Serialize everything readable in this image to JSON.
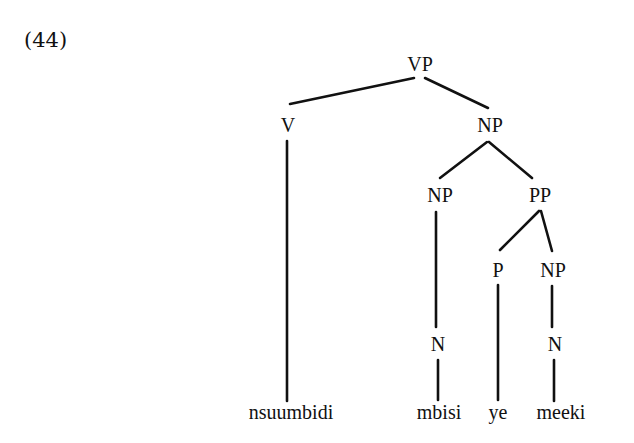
{
  "example_number": "(44)",
  "tree": {
    "nodes": {
      "vp": "VP",
      "v": "V",
      "np_obj": "NP",
      "np_head": "NP",
      "pp": "PP",
      "p": "P",
      "np_pp": "NP",
      "n1": "N",
      "n2": "N"
    },
    "words": {
      "w1": "nsuumbidi",
      "w2": "mbisi",
      "w3": "ye",
      "w4": "meeki"
    },
    "structure": "[VP [V nsuumbidi] [NP [NP [N mbisi]] [PP [P ye] [NP [N meeki]]]]]"
  }
}
